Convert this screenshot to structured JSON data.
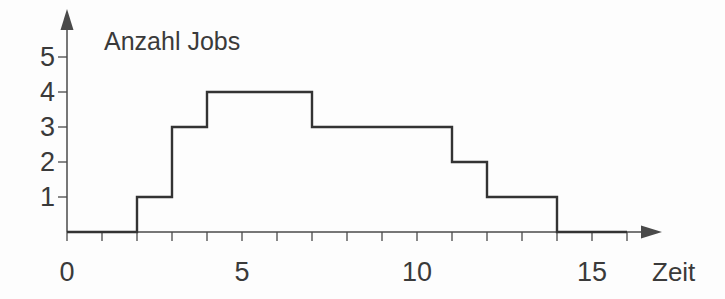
{
  "chart_data": {
    "type": "line",
    "subtype": "step",
    "title": "Anzahl Jobs",
    "xlabel": "Zeit",
    "ylabel": "Anzahl Jobs",
    "x_range": [
      0,
      16
    ],
    "y_range": [
      0,
      5
    ],
    "grid": false,
    "legend": null,
    "segments": [
      {
        "from": 0,
        "to": 2,
        "value": 0
      },
      {
        "from": 2,
        "to": 3,
        "value": 1
      },
      {
        "from": 3,
        "to": 4,
        "value": 3
      },
      {
        "from": 4,
        "to": 7,
        "value": 4
      },
      {
        "from": 7,
        "to": 11,
        "value": 3
      },
      {
        "from": 11,
        "to": 12,
        "value": 2
      },
      {
        "from": 12,
        "to": 14,
        "value": 1
      },
      {
        "from": 14,
        "to": 16,
        "value": 0
      }
    ],
    "x_ticks": [
      0,
      1,
      2,
      3,
      4,
      5,
      6,
      7,
      8,
      9,
      10,
      11,
      12,
      13,
      14,
      15,
      16
    ],
    "x_tick_labels": [
      {
        "value": 0,
        "label": "0"
      },
      {
        "value": 5,
        "label": "5"
      },
      {
        "value": 10,
        "label": "10"
      },
      {
        "value": 15,
        "label": "15"
      }
    ],
    "y_ticks": [
      1,
      2,
      3,
      4,
      5
    ],
    "y_tick_labels": [
      {
        "value": 1,
        "label": "1"
      },
      {
        "value": 2,
        "label": "2"
      },
      {
        "value": 3,
        "label": "3"
      },
      {
        "value": 4,
        "label": "4"
      },
      {
        "value": 5,
        "label": "5"
      }
    ],
    "line_color": "#333333",
    "axis_color": "#4a4a4a",
    "text_color": "#3a3a3a"
  }
}
